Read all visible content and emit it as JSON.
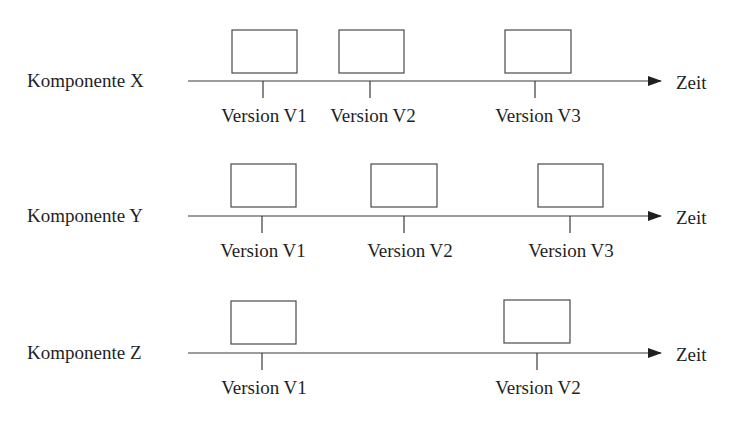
{
  "diagram": {
    "type": "component-version-timeline",
    "axis_label": "Zeit",
    "rows": [
      {
        "component": "Komponente X",
        "axis_y": 81,
        "label_y": 70,
        "versions": [
          {
            "label": "Version V1",
            "x": 264
          },
          {
            "label": "Version V2",
            "x": 371
          },
          {
            "label": "Version V3",
            "x": 537
          }
        ]
      },
      {
        "component": "Komponente Y",
        "axis_y": 216,
        "label_y": 205,
        "versions": [
          {
            "label": "Version V1",
            "x": 263
          },
          {
            "label": "Version V2",
            "x": 404
          },
          {
            "label": "Version V3",
            "x": 570
          }
        ]
      },
      {
        "component": "Komponente Z",
        "axis_y": 353,
        "label_y": 342,
        "versions": [
          {
            "label": "Version V1",
            "x": 263
          },
          {
            "label": "Version V2",
            "x": 537
          }
        ]
      }
    ]
  },
  "colors": {
    "line": "#3a3a3a",
    "text": "#1f1f1f",
    "background": "#ffffff"
  }
}
